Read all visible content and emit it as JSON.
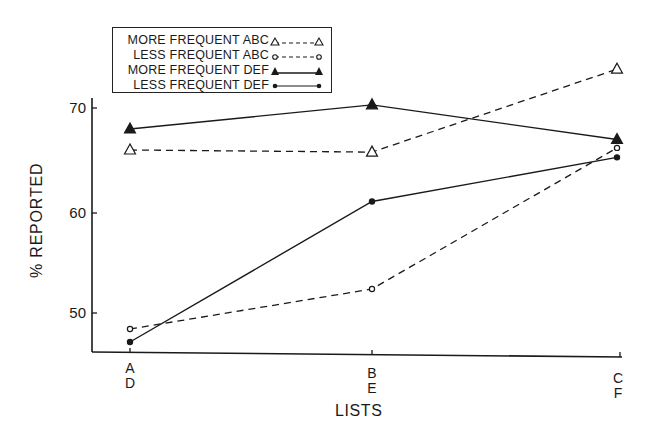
{
  "chart_data": {
    "type": "line",
    "title": "",
    "xlabel": "LISTS",
    "ylabel": "% REPORTED",
    "categories": [
      "A\nD",
      "B\nE",
      "C\nF"
    ],
    "category_top": [
      "A",
      "B",
      "C"
    ],
    "category_bottom": [
      "D",
      "E",
      "F"
    ],
    "yticks": [
      50,
      60,
      70
    ],
    "ylim": [
      46,
      75
    ],
    "grid": false,
    "legend_position": "top-left",
    "series": [
      {
        "name": "MORE FREQUENT ABC",
        "values": [
          66.0,
          65.8,
          73.7
        ],
        "line": "dashed",
        "marker": "open-triangle"
      },
      {
        "name": "LESS FREQUENT ABC",
        "values": [
          48.4,
          52.4,
          66.2
        ],
        "line": "dashed",
        "marker": "open-circle"
      },
      {
        "name": "MORE FREQUENT DEF",
        "values": [
          68.0,
          70.3,
          67.0
        ],
        "line": "solid",
        "marker": "filled-triangle"
      },
      {
        "name": "LESS FREQUENT DEF",
        "values": [
          47.1,
          61.1,
          65.3
        ],
        "line": "solid",
        "marker": "filled-circle"
      }
    ]
  },
  "legend": {
    "items": [
      {
        "label": "MORE FREQUENT ABC"
      },
      {
        "label": "LESS FREQUENT ABC"
      },
      {
        "label": "MORE FREQUENT DEF"
      },
      {
        "label": "LESS FREQUENT DEF"
      }
    ]
  },
  "axes": {
    "y_title": "% REPORTED",
    "x_title": "LISTS",
    "y_ticks": [
      "70",
      "60",
      "50"
    ],
    "x_ticks": [
      {
        "top": "A",
        "bottom": "D"
      },
      {
        "top": "B",
        "bottom": "E"
      },
      {
        "top": "C",
        "bottom": "F"
      }
    ]
  },
  "colors": {
    "ink": "#1a1a1a",
    "background": "#ffffff"
  }
}
